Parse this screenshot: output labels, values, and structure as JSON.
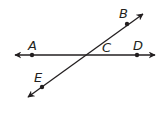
{
  "diagram": {
    "type": "geometry-intersecting-lines",
    "stroke_color": "#231f20",
    "background": "#ffffff",
    "lines": [
      {
        "name": "line-AD",
        "from": [
          15,
          55
        ],
        "to": [
          155,
          55
        ],
        "through": [
          "A",
          "C",
          "D"
        ],
        "arrows": "both"
      },
      {
        "name": "line-EB",
        "from": [
          28,
          97
        ],
        "to": [
          143,
          14
        ],
        "through": [
          "E",
          "C",
          "B"
        ],
        "arrows": "both"
      }
    ],
    "points": [
      {
        "label": "A",
        "x": 32,
        "y": 55,
        "dot": true,
        "label_x": 28,
        "label_y": 50
      },
      {
        "label": "B",
        "x": 127,
        "y": 24,
        "dot": true,
        "label_x": 119,
        "label_y": 18
      },
      {
        "label": "C",
        "x": 83,
        "y": 55,
        "dot": false,
        "label_x": 102,
        "label_y": 52
      },
      {
        "label": "D",
        "x": 137,
        "y": 55,
        "dot": true,
        "label_x": 133,
        "label_y": 50
      },
      {
        "label": "E",
        "x": 42,
        "y": 87,
        "dot": true,
        "label_x": 34,
        "label_y": 82
      }
    ]
  }
}
